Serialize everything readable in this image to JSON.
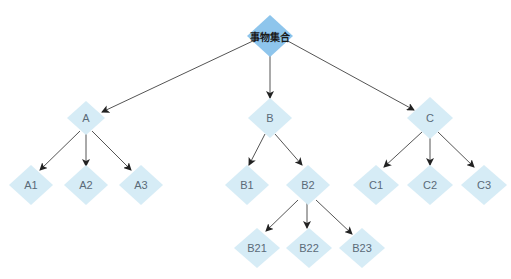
{
  "colors": {
    "root_fill": "#8ec5ec",
    "node_fill": "#d6ecf6",
    "edge": "#555555",
    "label": "#5a6a78"
  },
  "nodes": {
    "root": {
      "label": "事物集合",
      "x": 270,
      "y": 36,
      "w": 46,
      "h": 42
    },
    "A": {
      "label": "A",
      "x": 86,
      "y": 118,
      "w": 38,
      "h": 34
    },
    "B": {
      "label": "B",
      "x": 270,
      "y": 118,
      "w": 44,
      "h": 40
    },
    "C": {
      "label": "C",
      "x": 430,
      "y": 118,
      "w": 46,
      "h": 42
    },
    "A1": {
      "label": "A1",
      "x": 31,
      "y": 185,
      "w": 44,
      "h": 40
    },
    "A2": {
      "label": "A2",
      "x": 86,
      "y": 185,
      "w": 44,
      "h": 40
    },
    "A3": {
      "label": "A3",
      "x": 141,
      "y": 185,
      "w": 44,
      "h": 40
    },
    "B1": {
      "label": "B1",
      "x": 247,
      "y": 185,
      "w": 44,
      "h": 40
    },
    "B2": {
      "label": "B2",
      "x": 308,
      "y": 185,
      "w": 44,
      "h": 40
    },
    "C1": {
      "label": "C1",
      "x": 376,
      "y": 185,
      "w": 46,
      "h": 40
    },
    "C2": {
      "label": "C2",
      "x": 430,
      "y": 185,
      "w": 46,
      "h": 40
    },
    "C3": {
      "label": "C3",
      "x": 484,
      "y": 185,
      "w": 46,
      "h": 40
    },
    "B21": {
      "label": "B21",
      "x": 257,
      "y": 248,
      "w": 46,
      "h": 40
    },
    "B22": {
      "label": "B22",
      "x": 309,
      "y": 248,
      "w": 46,
      "h": 40
    },
    "B23": {
      "label": "B23",
      "x": 362,
      "y": 248,
      "w": 46,
      "h": 40
    }
  },
  "edges": [
    {
      "from": "root",
      "to": "A",
      "x1": 255,
      "y1": 40,
      "x2": 102,
      "y2": 112
    },
    {
      "from": "root",
      "to": "B",
      "x1": 270,
      "y1": 54,
      "x2": 270,
      "y2": 98
    },
    {
      "from": "root",
      "to": "C",
      "x1": 286,
      "y1": 40,
      "x2": 414,
      "y2": 110
    },
    {
      "from": "A",
      "to": "A1",
      "x1": 80,
      "y1": 131,
      "x2": 40,
      "y2": 170
    },
    {
      "from": "A",
      "to": "A2",
      "x1": 86,
      "y1": 133,
      "x2": 86,
      "y2": 166
    },
    {
      "from": "A",
      "to": "A3",
      "x1": 92,
      "y1": 131,
      "x2": 131,
      "y2": 170
    },
    {
      "from": "B",
      "to": "B1",
      "x1": 265,
      "y1": 134,
      "x2": 249,
      "y2": 165
    },
    {
      "from": "B",
      "to": "B2",
      "x1": 275,
      "y1": 134,
      "x2": 302,
      "y2": 165
    },
    {
      "from": "B2",
      "to": "B21",
      "x1": 298,
      "y1": 200,
      "x2": 266,
      "y2": 231
    },
    {
      "from": "B2",
      "to": "B22",
      "x1": 307,
      "y1": 203,
      "x2": 307,
      "y2": 228
    },
    {
      "from": "B2",
      "to": "B23",
      "x1": 316,
      "y1": 200,
      "x2": 352,
      "y2": 234
    },
    {
      "from": "C",
      "to": "C1",
      "x1": 422,
      "y1": 132,
      "x2": 384,
      "y2": 167
    },
    {
      "from": "C",
      "to": "C2",
      "x1": 430,
      "y1": 135,
      "x2": 430,
      "y2": 165
    },
    {
      "from": "C",
      "to": "C3",
      "x1": 438,
      "y1": 132,
      "x2": 474,
      "y2": 167
    }
  ]
}
